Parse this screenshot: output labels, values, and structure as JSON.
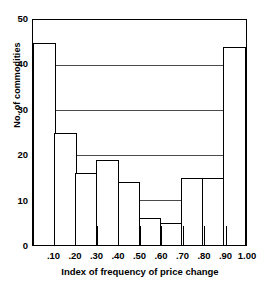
{
  "chart_data": {
    "type": "bar",
    "title": "",
    "xlabel": "Index of frequency of price change",
    "ylabel": "No. of commodities",
    "categories": [
      ".00-.10",
      ".10-.20",
      ".20-.30",
      ".30-.40",
      ".40-.50",
      ".50-.60",
      ".60-.70",
      ".70-.80",
      ".80-.90",
      ".90-1.00"
    ],
    "values": [
      45,
      25,
      16,
      19,
      14,
      6,
      5,
      15,
      15,
      44
    ],
    "xtick_labels": [
      ".10",
      ".20",
      ".30",
      ".40",
      ".50",
      ".60",
      ".70",
      ".80",
      ".90",
      "1.00"
    ],
    "xtick_values": [
      0.1,
      0.2,
      0.3,
      0.4,
      0.5,
      0.6,
      0.7,
      0.8,
      0.9,
      1.0
    ],
    "ytick_labels": [
      "0",
      "10",
      "20",
      "30",
      "40",
      "50"
    ],
    "ytick_values": [
      0,
      10,
      20,
      30,
      40,
      50
    ],
    "ylim": [
      0,
      50
    ],
    "xlim": [
      0,
      1.0
    ],
    "gridlines": [
      10,
      20,
      30,
      40
    ],
    "grid": true,
    "legend": null,
    "bar_fill_color": "#ffffff",
    "bar_edge_color": "#000000",
    "axis_color": "#000000",
    "grid_color": "#4a4a4a",
    "background_color": "#ffffff"
  }
}
